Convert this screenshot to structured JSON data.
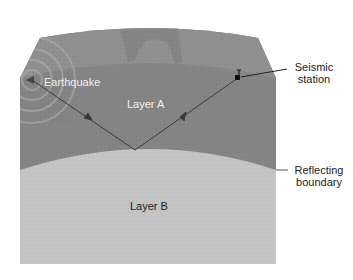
{
  "diagram": {
    "labels": {
      "earthquake": "Earthquake",
      "layer_a": "Layer A",
      "layer_b": "Layer B",
      "seismic_station_line1": "Seismic",
      "seismic_station_line2": "station",
      "reflecting_boundary_line1": "Reflecting",
      "reflecting_boundary_line2": "boundary"
    },
    "colors": {
      "surface_crust": "#8c8c8c",
      "layer_a": "#848484",
      "layer_b": "#c4c4c4",
      "ray": "#3a3a3a",
      "background": "#ffffff"
    },
    "elements": [
      {
        "type": "source",
        "name": "Earthquake"
      },
      {
        "type": "receiver",
        "name": "Seismic station"
      },
      {
        "type": "ray",
        "from": "Earthquake",
        "to": "Reflection point",
        "direction_arrow": true
      },
      {
        "type": "ray",
        "from": "Reflection point",
        "to": "Seismic station",
        "direction_arrow": true
      },
      {
        "type": "boundary",
        "name": "Reflecting boundary",
        "between": [
          "Layer A",
          "Layer B"
        ]
      }
    ]
  }
}
